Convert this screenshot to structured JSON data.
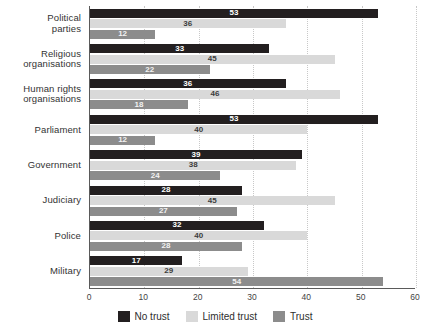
{
  "chart_data": {
    "type": "bar",
    "orientation": "horizontal",
    "title": "",
    "subtitle": "",
    "xlabel": "",
    "ylabel": "",
    "xlim": [
      0,
      60
    ],
    "xticks": [
      0,
      10,
      20,
      30,
      40,
      50,
      60
    ],
    "grid": true,
    "legend_position": "bottom-center",
    "categories": [
      "Political parties",
      "Religious organisations",
      "Human rights organisations",
      "Parliament",
      "Government",
      "Judiciary",
      "Police",
      "Military"
    ],
    "category_lines": [
      [
        "Political",
        "parties"
      ],
      [
        "Religious",
        "organisations"
      ],
      [
        "Human rights",
        "organisations"
      ],
      [
        "Parliament"
      ],
      [
        "Government"
      ],
      [
        "Judiciary"
      ],
      [
        "Police"
      ],
      [
        "Military"
      ]
    ],
    "series": [
      {
        "name": "No trust",
        "color": "#231f20",
        "values": [
          53,
          33,
          36,
          53,
          39,
          28,
          32,
          17
        ]
      },
      {
        "name": "Limited trust",
        "color": "#d9d9d9",
        "values": [
          36,
          45,
          46,
          40,
          38,
          45,
          40,
          29
        ]
      },
      {
        "name": "Trust",
        "color": "#8c8c8c",
        "values": [
          12,
          22,
          18,
          12,
          24,
          27,
          28,
          54
        ]
      }
    ]
  },
  "legend": {
    "items": [
      {
        "label": "No trust",
        "color": "#231f20"
      },
      {
        "label": "Limited trust",
        "color": "#d9d9d9"
      },
      {
        "label": "Trust",
        "color": "#8c8c8c"
      }
    ]
  },
  "axis": {
    "x_tick_labels": [
      "0",
      "10",
      "20",
      "30",
      "40",
      "50",
      "60"
    ]
  }
}
